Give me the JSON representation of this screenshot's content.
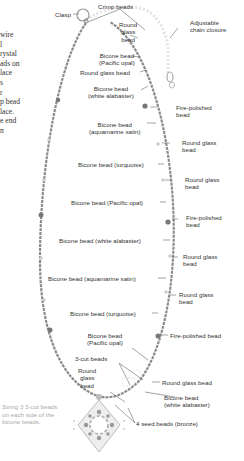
{
  "diagram": {
    "side_text_lines": [
      "wire",
      "l",
      "rystal",
      "ads on",
      "lace",
      "s",
      "r",
      "p bead",
      "lace.",
      "e end",
      "n"
    ],
    "labels": {
      "crimp_beads": "Crimp beads",
      "clasp": "Clasp",
      "round_glass_top": [
        "Round",
        "glass",
        "bead"
      ],
      "adjustable_chain": [
        "Adjustable",
        "chain closure"
      ],
      "bicone_pacific_1": [
        "Bicone bead",
        "(Pacific opal)"
      ],
      "round_glass_1": "Round glass bead",
      "bicone_white_1": [
        "Bicone bead",
        "(white alabaster)"
      ],
      "fire_polished_1": [
        "Fire-polished",
        "bead"
      ],
      "bicone_aqua_1": [
        "Bicone bead",
        "(aquamarine satin)"
      ],
      "round_glass_r1": [
        "Round glass",
        "bead"
      ],
      "bicone_turq_1": "Bicone bead (turquoise)",
      "round_glass_r2": [
        "Round glass",
        "bead"
      ],
      "bicone_pacific_2": "Bicone bead (Pacific opal)",
      "fire_polished_2": [
        "Fire-polished",
        "bead"
      ],
      "bicone_white_2": "Bicone bead (white alabaster)",
      "round_glass_r3": [
        "Round glass",
        "bead"
      ],
      "bicone_aqua_2": "Bicone bead (aquamarine satin)",
      "round_glass_r4": [
        "Round glass",
        "bead"
      ],
      "bicone_turq_2": "Bicone bead (turquoise)",
      "fire_polished_3": "Fire-polished bead",
      "bicone_pacific_3": [
        "Bicone bead",
        "(Pacific opal)"
      ],
      "three_cut": "3-cut beads",
      "round_glass_r5": "Round glass bead",
      "round_glass_bottom": [
        "Round",
        "glass",
        "bead"
      ],
      "bicone_white_3": [
        "Bicone bead",
        "(white alabaster)"
      ],
      "seed_beads": "4 seed beads (bronze)"
    },
    "note": [
      "String 3 3-cut beads",
      "on each side of the",
      "bicone beads."
    ]
  }
}
